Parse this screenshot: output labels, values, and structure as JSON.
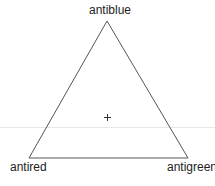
{
  "diagram": {
    "type": "ternary-triangle",
    "vertices": {
      "top": "antiblue",
      "bottom_left": "antired",
      "bottom_right": "antigreen"
    },
    "center_marker": "+",
    "colors": {
      "stroke": "#555555",
      "guide_line": "#e6e6e6",
      "text": "#222222"
    }
  }
}
